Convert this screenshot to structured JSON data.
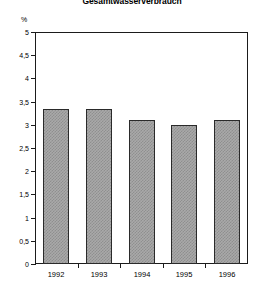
{
  "chart_data": {
    "type": "bar",
    "title": "Gesamtwasserverbrauch",
    "xlabel": "",
    "ylabel": "%",
    "categories": [
      "1992",
      "1993",
      "1994",
      "1995",
      "1996"
    ],
    "values": [
      3.35,
      3.35,
      3.1,
      3.0,
      3.1
    ],
    "ylim": [
      0,
      5
    ],
    "ytick_labels": [
      "0",
      "0,5",
      "1",
      "1,5",
      "2",
      "2,5",
      "3",
      "3,5",
      "4",
      "4,5",
      "5"
    ],
    "ytick_values": [
      0,
      0.5,
      1,
      1.5,
      2,
      2.5,
      3,
      3.5,
      4,
      4.5,
      5
    ],
    "grid": false,
    "legend": null,
    "bar_fill": "#a9a9a9",
    "bar_edge": "#2a2a2a",
    "frame_color": "#1b1b1b",
    "background": "#ffffff"
  }
}
